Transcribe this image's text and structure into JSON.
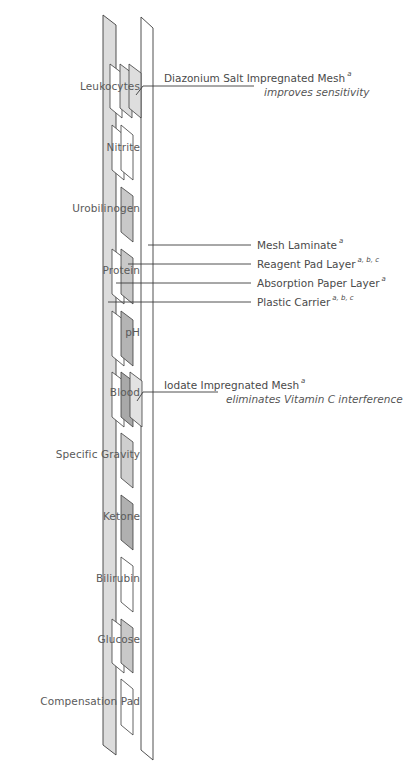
{
  "diagram": {
    "colors": {
      "carrier_fill": "#dcdcdc",
      "outline": "#3c3c3c",
      "pad_light": "#dedede",
      "pad_mid": "#c8c8c8",
      "pad_dark": "#a9a9a9",
      "pad_white": "#ffffff"
    },
    "test_pads": [
      {
        "label": "Leukocytes",
        "pad_color": "light",
        "layers": [
          "absorption-paper",
          "reagent-pad",
          "mesh"
        ]
      },
      {
        "label": "Nitrite",
        "pad_color": "white",
        "layers": [
          "absorption-paper",
          "reagent-pad"
        ]
      },
      {
        "label": "Urobilinogen",
        "pad_color": "mid",
        "layers": [
          "reagent-pad"
        ]
      },
      {
        "label": "Protein",
        "pad_color": "mid",
        "layers": [
          "absorption-paper",
          "reagent-pad"
        ]
      },
      {
        "label": "pH",
        "pad_color": "dark",
        "layers": [
          "absorption-paper",
          "reagent-pad"
        ]
      },
      {
        "label": "Blood",
        "pad_color": "dark",
        "layers": [
          "absorption-paper",
          "reagent-pad",
          "mesh"
        ]
      },
      {
        "label": "Specific Gravity",
        "pad_color": "mid",
        "layers": [
          "reagent-pad"
        ]
      },
      {
        "label": "Ketone",
        "pad_color": "dark",
        "layers": [
          "reagent-pad"
        ]
      },
      {
        "label": "Bilirubin",
        "pad_color": "white",
        "layers": [
          "reagent-pad"
        ]
      },
      {
        "label": "Glucose",
        "pad_color": "mid",
        "layers": [
          "absorption-paper",
          "reagent-pad"
        ]
      },
      {
        "label": "Compensation Pad",
        "pad_color": "white",
        "layers": [
          "reagent-pad"
        ]
      }
    ],
    "callouts": {
      "diazonium": {
        "label": "Diazonium Salt Impregnated Mesh",
        "superscript": "a",
        "note": "improves sensitivity"
      },
      "mesh_laminate": {
        "label": "Mesh Laminate",
        "superscript": "a"
      },
      "reagent_pad_layer": {
        "label": "Reagent Pad Layer",
        "superscript": "a, b, c"
      },
      "absorption_paper_layer": {
        "label": "Absorption Paper Layer",
        "superscript": "a"
      },
      "plastic_carrier": {
        "label": "Plastic Carrier",
        "superscript": "a, b, c"
      },
      "iodate": {
        "label": "Iodate Impregnated Mesh",
        "superscript": "a",
        "note": "eliminates Vitamin C interference"
      }
    }
  }
}
